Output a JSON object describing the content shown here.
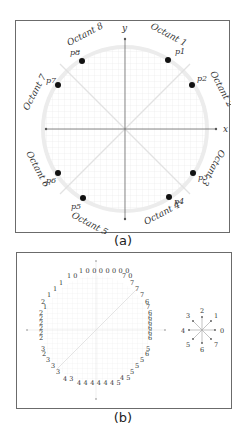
{
  "figure": {
    "panel_a": {
      "caption": "(a)",
      "axes": {
        "x_label": "x",
        "y_label": "y"
      },
      "octants": [
        {
          "label": "Octant 1",
          "point": "p1"
        },
        {
          "label": "Octant 2",
          "point": "p2"
        },
        {
          "label": "Octant 3",
          "point": "p3"
        },
        {
          "label": "Octant 4",
          "point": "p4"
        },
        {
          "label": "Octant 5",
          "point": "p5"
        },
        {
          "label": "Octant 6",
          "point": "p6"
        },
        {
          "label": "Octant 7",
          "point": "p7"
        },
        {
          "label": "Octant 8",
          "point": "p8"
        }
      ]
    },
    "panel_b": {
      "caption": "(b)",
      "chain_code": {
        "top": "1 0 0 0 0 0 0 0",
        "top_left": "1 0",
        "top_right": "7 0",
        "upper_right": [
          "7",
          "7",
          "7",
          "6",
          "7"
        ],
        "right_column": [
          "6",
          "6",
          "6",
          "6",
          "6",
          "6"
        ],
        "lower_right": [
          "5",
          "6",
          "5",
          "5",
          "5"
        ],
        "bottom_right": "4 5",
        "bottom": "4 4 4 4 4 4 5",
        "bottom_left": "4 3",
        "lower_left": [
          "3",
          "3",
          "3",
          "2",
          "3"
        ],
        "left_column": [
          "2",
          "2",
          "2",
          "2",
          "2",
          "2"
        ],
        "upper_left": [
          "2",
          "1",
          "1",
          "1",
          "1"
        ]
      },
      "direction_legend": {
        "directions": [
          {
            "code": "0",
            "angle": 0
          },
          {
            "code": "1",
            "angle": 45
          },
          {
            "code": "2",
            "angle": 90
          },
          {
            "code": "3",
            "angle": 135
          },
          {
            "code": "4",
            "angle": 180
          },
          {
            "code": "5",
            "angle": 225
          },
          {
            "code": "6",
            "angle": 270
          },
          {
            "code": "7",
            "angle": 315
          }
        ]
      }
    }
  }
}
